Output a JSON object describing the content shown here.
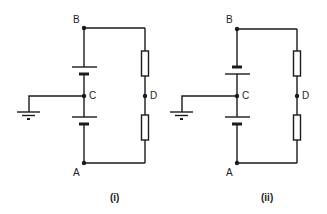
{
  "diagrams": [
    {
      "caption": "(i)",
      "nodes": {
        "B": "B",
        "C": "C",
        "D": "D",
        "A": "A"
      },
      "top_battery": "long plate up",
      "bottom_battery": "long plate up"
    },
    {
      "caption": "(ii)",
      "nodes": {
        "B": "B",
        "C": "C",
        "D": "D",
        "A": "A"
      },
      "top_battery": "short plate up",
      "bottom_battery": "long plate up"
    }
  ],
  "colors": {
    "line": "#1a1a1a",
    "background": "#ffffff"
  }
}
